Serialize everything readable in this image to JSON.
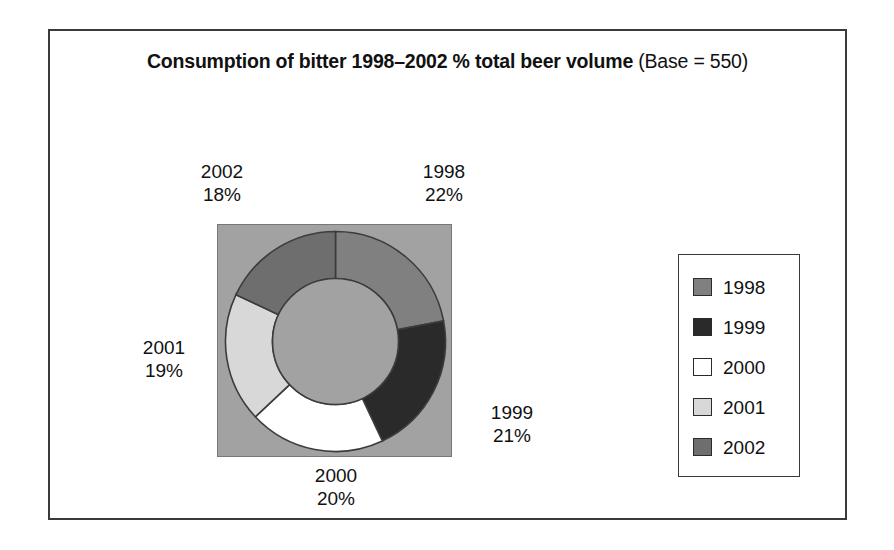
{
  "figure": {
    "title_main": "Consumption of bitter 1998–2002 % total beer volume",
    "title_base": " (Base = 550)"
  },
  "legend": {
    "items": [
      {
        "label": "1998",
        "color": "#808080"
      },
      {
        "label": "1999",
        "color": "#2a2a2a"
      },
      {
        "label": "2000",
        "color": "#ffffff"
      },
      {
        "label": "2001",
        "color": "#d8d8d8"
      },
      {
        "label": "2002",
        "color": "#6e6e6e"
      }
    ]
  },
  "labels": {
    "y2002": {
      "year": "2002",
      "value": "18%"
    },
    "y1998": {
      "year": "1998",
      "value": "22%"
    },
    "y2001": {
      "year": "2001",
      "value": "19%"
    },
    "y1999": {
      "year": "1999",
      "value": "21%"
    },
    "y2000": {
      "year": "2000",
      "value": "20%"
    }
  },
  "chart_data": {
    "type": "pie",
    "variant": "donut",
    "title": "Consumption of bitter 1998–2002 % total beer volume (Base = 550)",
    "base": 550,
    "units": "% total beer volume",
    "categories": [
      "1998",
      "1999",
      "2000",
      "2001",
      "2002"
    ],
    "values": [
      22,
      21,
      20,
      19,
      18
    ],
    "value_labels": [
      "22%",
      "21%",
      "20%",
      "19%",
      "18%"
    ],
    "colors": [
      "#808080",
      "#2a2a2a",
      "#ffffff",
      "#d8d8d8",
      "#6e6e6e"
    ],
    "start_angle_deg": 0,
    "direction": "clockwise",
    "inner_radius_ratio": 0.55,
    "plot_background": "#a2a2a2",
    "legend_position": "right",
    "grid": false,
    "xlabel": "",
    "ylabel": ""
  }
}
